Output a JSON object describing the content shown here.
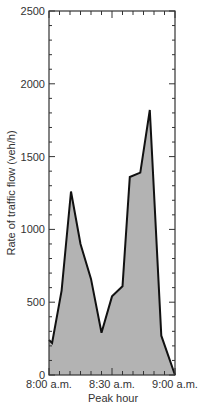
{
  "chart_data": {
    "type": "area",
    "title": "",
    "xlabel": "Peak hour",
    "ylabel": "Rate of traffic flow (veh/h)",
    "ylim": [
      0,
      2500
    ],
    "yticks": [
      0,
      500,
      1000,
      1500,
      2000,
      2500
    ],
    "xtick_labels": [
      "8:00 a.m.",
      "8:30 a.m.",
      "9:00 a.m."
    ],
    "grid": false,
    "legend": null,
    "x_minutes": [
      0,
      1.5,
      6,
      10.5,
      15,
      20,
      25,
      30,
      35,
      38.5,
      43.5,
      48,
      53.5,
      60
    ],
    "values": [
      240,
      220,
      580,
      1260,
      900,
      660,
      290,
      540,
      610,
      1360,
      1390,
      1820,
      270,
      0
    ],
    "colors": {
      "fill": "#b3b3b3",
      "line": "#111111",
      "axis": "#333333"
    }
  },
  "axes": {
    "y_labels": [
      "0",
      "500",
      "1000",
      "1500",
      "2000",
      "2500"
    ],
    "x_labels": [
      "8:00 a.m.",
      "8:30 a.m.",
      "9:00 a.m."
    ],
    "xlabel": "Peak hour",
    "ylabel": "Rate of traffic flow (veh/h)"
  }
}
